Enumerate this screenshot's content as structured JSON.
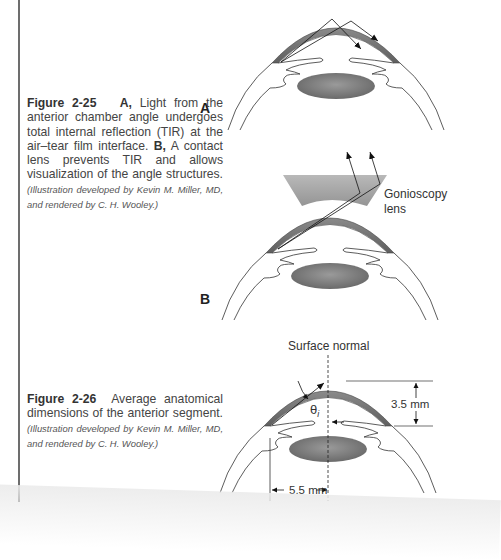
{
  "figures": [
    {
      "number": "Figure 2-25",
      "caption_parts": {
        "a_label": "A,",
        "a_text": " Light from the anterior chamber angle undergoes total internal reflection (TIR) at the air–tear film interface. ",
        "b_label": "B,",
        "b_text": " A contact lens prevents TIR and allows visualization of the angle structures. ",
        "credit": "(Illustration developed by Kevin M. Miller, MD, and rendered by C. H. Wooley.)"
      },
      "panels": [
        {
          "label": "A"
        },
        {
          "label": "B",
          "annotation": "Gonioscopy lens",
          "annotation_line1": "Gonioscopy",
          "annotation_line2": "lens"
        }
      ]
    },
    {
      "number": "Figure 2-26",
      "caption_text": " Average anatomical dimensions of the anterior segment. ",
      "credit": "(Illustration developed by Kevin M. Miller, MD, and rendered by C. H. Wooley.)",
      "labels": {
        "surface_normal": "Surface normal",
        "theta": "θ",
        "theta_sub": "i",
        "height": "3.5 mm",
        "width": "5.5 mm"
      }
    }
  ],
  "colors": {
    "cornea": "#6e6e6e",
    "lens": "#7a7a7a",
    "gonio_lens": "#a9a9a9",
    "rule": "#6d6d6d"
  }
}
